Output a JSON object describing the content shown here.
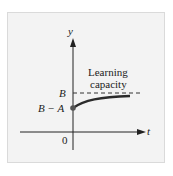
{
  "figure": {
    "axes": {
      "x_label": "t",
      "y_label": "y",
      "origin_label": "0"
    },
    "y_ticks": [
      {
        "label": "B",
        "role": "asymptote"
      },
      {
        "label": "B − A",
        "role": "initial-value"
      }
    ],
    "annotation": {
      "line1": "Learning",
      "line2": "capacity"
    },
    "curve": {
      "description": "y = B - A e^{-kt}, increasing toward asymptote B",
      "color": "#2b2b2b"
    },
    "asymptote_style": "dashed",
    "colors": {
      "panel": "#f3f3f3",
      "ink": "#222222"
    }
  }
}
